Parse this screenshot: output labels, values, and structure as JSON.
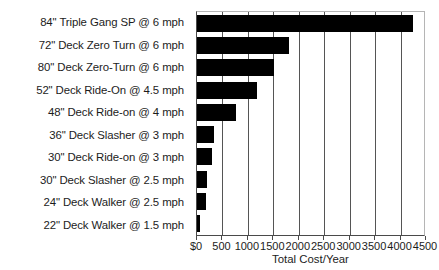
{
  "chart_data": {
    "type": "bar",
    "orientation": "horizontal",
    "title": "",
    "xlabel": "Total Cost/Year",
    "ylabel": "",
    "xlim": [
      0,
      4500
    ],
    "xticks": [
      0,
      500,
      1000,
      1500,
      2000,
      2500,
      3000,
      3500,
      4000,
      4500
    ],
    "xtick_labels": [
      "$0",
      "500",
      "1000",
      "1500",
      "2000",
      "2500",
      "3000",
      "3500",
      "4000",
      "4500"
    ],
    "grid": true,
    "grid_axis": "x",
    "legend": false,
    "bar_color": "#000000",
    "categories": [
      "84\" Triple Gang SP @ 6 mph",
      "72\" Deck Zero Turn @ 6 mph",
      "80\" Deck Zero-Turn @ 6 mph",
      "52\" Deck Ride-On @ 4.5 mph",
      "48\" Deck Ride-on @ 4 mph",
      "36\" Deck Slasher @ 3 mph",
      "30\" Deck Ride-on @ 3 mph",
      "30\" Deck Slasher @ 2.5 mph",
      "24\" Deck Walker @ 2.5 mph",
      "22\" Deck Walker @ 1.5 mph"
    ],
    "values": [
      4250,
      1810,
      1510,
      1180,
      770,
      335,
      295,
      195,
      175,
      60
    ]
  }
}
